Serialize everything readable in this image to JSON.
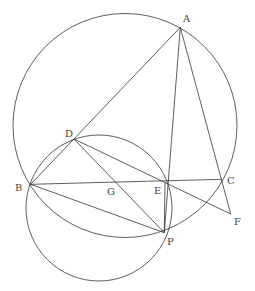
{
  "diagram": {
    "type": "geometry",
    "points": {
      "A": [
        180.3,
        27.3
      ],
      "B": [
        30.7,
        184.3
      ],
      "C": [
        221.7,
        179.3
      ],
      "D": [
        74,
        139
      ],
      "E": [
        165,
        182
      ],
      "F": [
        230.7,
        214
      ],
      "G": [
        112,
        183
      ],
      "P": [
        164.3,
        232.7
      ]
    },
    "labels": [
      {
        "text": "A",
        "x": 183,
        "y": 22
      },
      {
        "text": "B",
        "x": 15,
        "y": 191
      },
      {
        "text": "C",
        "x": 227,
        "y": 184
      },
      {
        "text": "D",
        "x": 65,
        "y": 137
      },
      {
        "text": "E",
        "x": 154,
        "y": 194
      },
      {
        "text": "F",
        "x": 234,
        "y": 225
      },
      {
        "text": "G",
        "x": 107,
        "y": 195
      },
      {
        "text": "P",
        "x": 167,
        "y": 245
      }
    ],
    "circles": [
      {
        "name": "circumcircle-ABC",
        "cx": 125,
        "cy": 125.5,
        "r": 112
      },
      {
        "name": "circle-BDP",
        "cx": 99,
        "cy": 208,
        "r": 73
      }
    ],
    "segments": [
      [
        "A",
        "B"
      ],
      [
        "A",
        "P"
      ],
      [
        "A",
        "F"
      ],
      [
        "B",
        "C"
      ],
      [
        "D",
        "F"
      ],
      [
        "D",
        "P"
      ],
      [
        "B",
        "P"
      ],
      [
        "E",
        "P"
      ]
    ]
  }
}
